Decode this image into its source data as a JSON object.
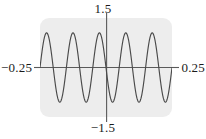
{
  "figure": {
    "background_color": "#ffffff",
    "plot_background_color": "#ededed",
    "axis_color": "#5a5a5a",
    "curve_color": "#4a4a4a",
    "label_color": "#1a1a1a"
  },
  "labels": {
    "top": "1.5",
    "bottom": "−1.5",
    "left": "−0.25",
    "right": "0.25"
  },
  "chart_data": {
    "type": "line",
    "title": "",
    "xlabel": "",
    "ylabel": "",
    "xlim": [
      -0.25,
      0.25
    ],
    "ylim": [
      -1.5,
      1.5
    ],
    "xtick_labels": [
      "−0.25",
      "0.25"
    ],
    "ytick_labels": [
      "−1.5",
      "1.5"
    ],
    "grid": false,
    "legend": false,
    "series": [
      {
        "name": "sine wave",
        "amplitude": 1.05,
        "cycles_in_range": 5,
        "period": 0.1,
        "x": [
          -0.25,
          -0.2375,
          -0.225,
          -0.2125,
          -0.2,
          -0.1875,
          -0.175,
          -0.1625,
          -0.15,
          -0.1375,
          -0.125,
          -0.1125,
          -0.1,
          -0.0875,
          -0.075,
          -0.0625,
          -0.05,
          -0.0375,
          -0.025,
          -0.0125,
          0,
          0.0125,
          0.025,
          0.0375,
          0.05,
          0.0625,
          0.075,
          0.0875,
          0.1,
          0.1125,
          0.125,
          0.1375,
          0.15,
          0.1625,
          0.175,
          0.1875,
          0.2,
          0.2125,
          0.225,
          0.2375,
          0.25
        ],
        "y": [
          0,
          0.742,
          1.05,
          0.742,
          0,
          -0.742,
          -1.05,
          -0.742,
          0,
          0.742,
          1.05,
          0.742,
          0,
          -0.742,
          -1.05,
          -0.742,
          0,
          0.742,
          1.05,
          0.742,
          0,
          -0.742,
          -1.05,
          -0.742,
          0,
          0.742,
          1.05,
          0.742,
          0,
          -0.742,
          -1.05,
          -0.742,
          0,
          0.742,
          1.05,
          0.742,
          0,
          -0.742,
          -1.05,
          -0.742,
          0
        ]
      }
    ]
  }
}
